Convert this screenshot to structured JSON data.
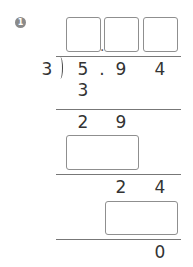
{
  "problem": {
    "number": "1",
    "divisor": "3",
    "dividend_digits": [
      "5",
      ".",
      "9",
      "4"
    ],
    "quotient_boxes": [
      "",
      "",
      ""
    ],
    "quotient_decimal_point": ".",
    "steps": [
      {
        "subtract": "3"
      },
      {
        "remainder": [
          "2",
          "9"
        ],
        "subtract_box": ""
      },
      {
        "remainder": [
          "2",
          "4"
        ],
        "subtract_box": ""
      }
    ],
    "final_remainder": "0"
  }
}
